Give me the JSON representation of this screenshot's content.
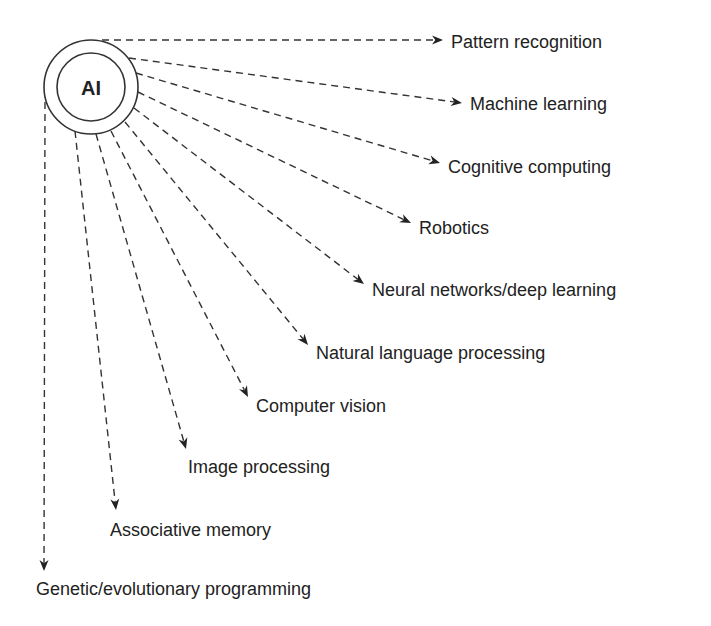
{
  "diagram": {
    "center": {
      "label": "AI",
      "cx": 91,
      "cy": 87,
      "outer_r": 47,
      "inner_r": 34
    },
    "line_color": "#333333",
    "text_color": "#222222",
    "branches": [
      {
        "label": "Pattern recognition",
        "start": [
          102,
          40
        ],
        "end": [
          443,
          40
        ],
        "text_x": 451,
        "text_y": 48
      },
      {
        "label": "Machine learning",
        "start": [
          129,
          58
        ],
        "end": [
          462,
          103
        ],
        "text_x": 470,
        "text_y": 110
      },
      {
        "label": "Cognitive computing",
        "start": [
          136,
          73
        ],
        "end": [
          440,
          163
        ],
        "text_x": 448,
        "text_y": 173
      },
      {
        "label": "Robotics",
        "start": [
          138,
          92
        ],
        "end": [
          411,
          223
        ],
        "text_x": 419,
        "text_y": 234
      },
      {
        "label": "Neural networks/deep learning",
        "start": [
          134,
          108
        ],
        "end": [
          364,
          284
        ],
        "text_x": 372,
        "text_y": 296
      },
      {
        "label": "Natural language processing",
        "start": [
          125,
          122
        ],
        "end": [
          308,
          345
        ],
        "text_x": 316,
        "text_y": 359
      },
      {
        "label": "Computer vision",
        "start": [
          111,
          131
        ],
        "end": [
          248,
          397
        ],
        "text_x": 256,
        "text_y": 412
      },
      {
        "label": "Image processing",
        "start": [
          96,
          134
        ],
        "end": [
          186,
          449
        ],
        "text_x": 188,
        "text_y": 473
      },
      {
        "label": "Associative memory",
        "start": [
          75,
          131
        ],
        "end": [
          116,
          510
        ],
        "text_x": 110,
        "text_y": 536
      },
      {
        "label": "Genetic/evolutionary programming",
        "start": [
          45,
          102
        ],
        "end": [
          44,
          571
        ],
        "text_x": 36,
        "text_y": 595
      }
    ]
  }
}
